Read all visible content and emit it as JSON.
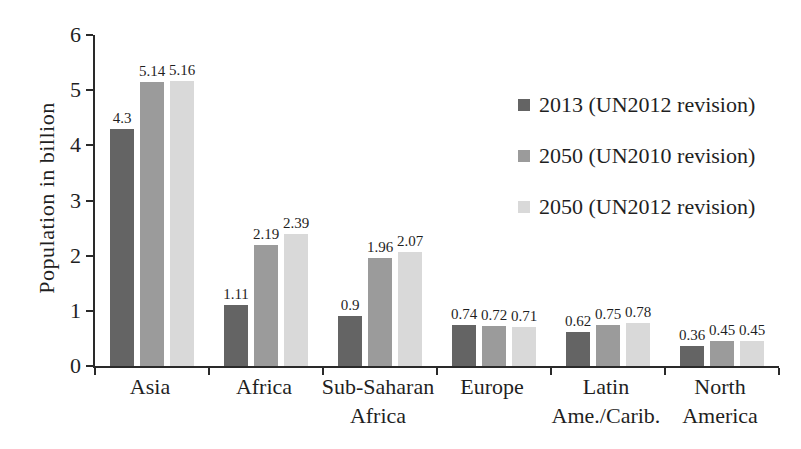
{
  "chart_data": {
    "type": "bar",
    "title": "",
    "xlabel": "",
    "ylabel": "Population in billion",
    "ylim": [
      0,
      6
    ],
    "yticks": [
      0,
      1,
      2,
      3,
      4,
      5,
      6
    ],
    "grid": false,
    "legend_position": "upper right inside plot",
    "bar_value_labels": true,
    "axis_color": "#2a2a2a",
    "text_color": "#1f1f1f",
    "categories": [
      "Asia",
      "Africa",
      "Sub-Saharan Africa",
      "Europe",
      "Latin Ame./Carib.",
      "North America"
    ],
    "series": [
      {
        "name": "2013 (UN2012 revision)",
        "color": "#646464",
        "values": [
          4.3,
          1.11,
          0.9,
          0.74,
          0.62,
          0.36
        ]
      },
      {
        "name": "2050 (UN2010 revision)",
        "color": "#9b9b9b",
        "values": [
          5.14,
          2.19,
          1.96,
          0.72,
          0.75,
          0.45
        ]
      },
      {
        "name": "2050 (UN2012 revision)",
        "color": "#d9d9d9",
        "values": [
          5.16,
          2.39,
          2.07,
          0.71,
          0.78,
          0.45
        ]
      }
    ]
  }
}
